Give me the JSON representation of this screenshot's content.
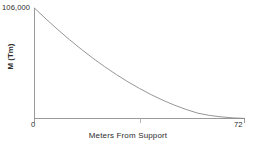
{
  "chart_data": {
    "type": "line",
    "title": "",
    "subtitle": "",
    "xlabel": "Meters From Support",
    "ylabel": "M (Tm)",
    "xlim": [
      0,
      72
    ],
    "ylim": [
      0,
      106000
    ],
    "grid": false,
    "legend": null,
    "x_tick_labels": [
      "0",
      "72"
    ],
    "x_tick_values": [
      0,
      72
    ],
    "y_tick_labels": [
      "106,000"
    ],
    "y_tick_values": [
      106000
    ],
    "minor_x_ticks": [
      36
    ],
    "annotations": [],
    "series": [
      {
        "name": "Bending moment",
        "color": "#8a8a8a",
        "x": [
          0,
          4,
          8,
          12,
          16,
          20,
          24,
          28,
          32,
          36,
          40,
          44,
          48,
          52,
          56,
          60,
          64,
          68,
          72
        ],
        "values": [
          106000,
          95400,
          85280,
          75650,
          66520,
          57900,
          49800,
          42230,
          35200,
          28720,
          22800,
          17450,
          12690,
          8530,
          5000,
          2860,
          1450,
          480,
          0
        ]
      }
    ]
  },
  "axis": {
    "y_max_label": "106,000",
    "x_min_label": "0",
    "x_max_label": "72",
    "x_title": "Meters From Support",
    "y_title": "M (Tm)"
  },
  "style": {
    "axis_color": "#9a9a9a",
    "curve_color": "#8a8a8a",
    "text_color": "#2b2b2b",
    "background": "#ffffff"
  }
}
